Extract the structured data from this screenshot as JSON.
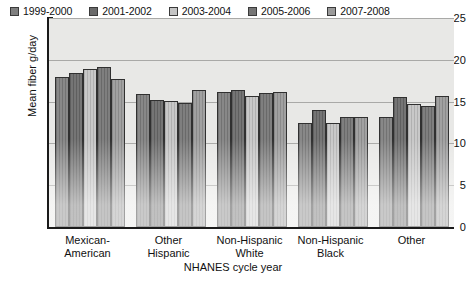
{
  "chart_data": {
    "type": "bar",
    "title": "",
    "xlabel": "NHANES cycle year",
    "ylabel": "Mean fiber g/day",
    "ylim": [
      0,
      25
    ],
    "yticks": [
      0,
      5,
      10,
      15,
      20,
      25
    ],
    "ytick_labels": [
      "0",
      "5",
      "10",
      "15",
      "20",
      "25"
    ],
    "grid": "horizontal",
    "legend_position": "top-inside-left",
    "categories": [
      "Mexican-\nAmerican",
      "Other\nHispanic",
      "Non-Hispanic\nWhite",
      "Non-Hispanic\nBlack",
      "Other"
    ],
    "series": [
      {
        "name": "1999-2000",
        "color": "#7f7f7f",
        "values": [
          18.0,
          15.9,
          16.1,
          12.5,
          13.2
        ]
      },
      {
        "name": "2001-2002",
        "color": "#6a6a6a",
        "values": [
          18.4,
          15.2,
          16.4,
          14.0,
          15.5
        ]
      },
      {
        "name": "2003-2004",
        "color": "#c4c4c4",
        "values": [
          18.9,
          15.1,
          15.7,
          12.4,
          14.7
        ]
      },
      {
        "name": "2005-2006",
        "color": "#757575",
        "values": [
          19.1,
          14.8,
          16.0,
          13.1,
          14.5
        ]
      },
      {
        "name": "2007-2008",
        "color": "#9a9a9a",
        "values": [
          17.7,
          16.4,
          16.1,
          13.1,
          15.7
        ]
      }
    ]
  },
  "colors": {
    "plot_background": "#e8e8e6",
    "axis": "#1a1a1a",
    "gridline": "#a9a9a7",
    "text": "#111111"
  }
}
